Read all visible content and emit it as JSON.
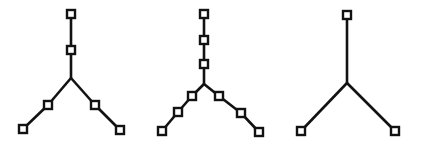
{
  "figure": {
    "background_color": "#ffffff",
    "stroke_color": "#121212",
    "node_fill_color": "#ffffff",
    "node_size": 8,
    "edge_width": 2.6,
    "canvas": {
      "width": 423,
      "height": 149
    },
    "caption": "",
    "diagram_type": "node-link tree",
    "trees": [
      {
        "name": "tree-left",
        "label": "",
        "node_count": 6,
        "leaf_count": 3,
        "junction": {
          "x": 71,
          "y": 78
        },
        "nodes": [
          {
            "id": "L-root",
            "x": 71,
            "y": 14,
            "role": "root-leaf"
          },
          {
            "id": "L-stem-1",
            "x": 71,
            "y": 50,
            "role": "internal"
          },
          {
            "id": "L-branch-left",
            "x": 48,
            "y": 105,
            "role": "internal"
          },
          {
            "id": "L-leaf-left",
            "x": 23,
            "y": 129,
            "role": "leaf"
          },
          {
            "id": "L-branch-right",
            "x": 95,
            "y": 105,
            "role": "internal"
          },
          {
            "id": "L-leaf-right",
            "x": 120,
            "y": 130,
            "role": "leaf"
          }
        ],
        "edges": [
          {
            "from": "L-root",
            "to": "L-stem-1"
          },
          {
            "from": "L-stem-1",
            "to": "junction"
          },
          {
            "from": "junction",
            "to": "L-branch-left"
          },
          {
            "from": "L-branch-left",
            "to": "L-leaf-left"
          },
          {
            "from": "junction",
            "to": "L-branch-right"
          },
          {
            "from": "L-branch-right",
            "to": "L-leaf-right"
          }
        ]
      },
      {
        "name": "tree-middle",
        "label": "",
        "node_count": 9,
        "leaf_count": 3,
        "junction": {
          "x": 204,
          "y": 84
        },
        "nodes": [
          {
            "id": "M-root",
            "x": 204,
            "y": 14,
            "role": "root-leaf"
          },
          {
            "id": "M-stem-1",
            "x": 204,
            "y": 40,
            "role": "internal"
          },
          {
            "id": "M-stem-2",
            "x": 204,
            "y": 64,
            "role": "internal"
          },
          {
            "id": "M-branch-left-1",
            "x": 192,
            "y": 96,
            "role": "internal"
          },
          {
            "id": "M-branch-left-2",
            "x": 178,
            "y": 112,
            "role": "internal"
          },
          {
            "id": "M-leaf-left",
            "x": 162,
            "y": 131,
            "role": "leaf"
          },
          {
            "id": "M-branch-right-1",
            "x": 219,
            "y": 96,
            "role": "internal"
          },
          {
            "id": "M-branch-right-2",
            "x": 241,
            "y": 113,
            "role": "internal"
          },
          {
            "id": "M-leaf-right",
            "x": 259,
            "y": 132,
            "role": "leaf"
          }
        ],
        "edges": [
          {
            "from": "M-root",
            "to": "M-stem-1"
          },
          {
            "from": "M-stem-1",
            "to": "M-stem-2"
          },
          {
            "from": "M-stem-2",
            "to": "junction"
          },
          {
            "from": "junction",
            "to": "M-branch-left-1"
          },
          {
            "from": "M-branch-left-1",
            "to": "M-branch-left-2"
          },
          {
            "from": "M-branch-left-2",
            "to": "M-leaf-left"
          },
          {
            "from": "junction",
            "to": "M-branch-right-1"
          },
          {
            "from": "M-branch-right-1",
            "to": "M-branch-right-2"
          },
          {
            "from": "M-branch-right-2",
            "to": "M-leaf-right"
          }
        ]
      },
      {
        "name": "tree-right",
        "label": "",
        "node_count": 3,
        "leaf_count": 3,
        "junction": {
          "x": 347,
          "y": 83
        },
        "nodes": [
          {
            "id": "R-root",
            "x": 347,
            "y": 15,
            "role": "root-leaf"
          },
          {
            "id": "R-leaf-left",
            "x": 301,
            "y": 131,
            "role": "leaf"
          },
          {
            "id": "R-leaf-right",
            "x": 395,
            "y": 131,
            "role": "leaf"
          }
        ],
        "edges": [
          {
            "from": "R-root",
            "to": "junction"
          },
          {
            "from": "junction",
            "to": "R-leaf-left"
          },
          {
            "from": "junction",
            "to": "R-leaf-right"
          }
        ]
      }
    ]
  }
}
